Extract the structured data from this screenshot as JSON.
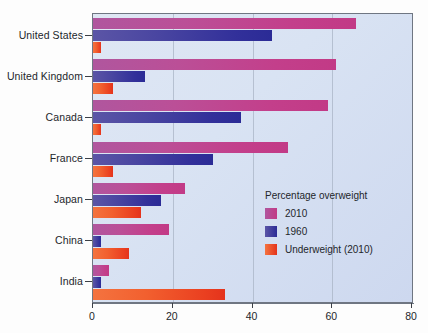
{
  "chart_data": {
    "type": "bar",
    "orientation": "horizontal",
    "title": "",
    "xlabel": "",
    "ylabel": "",
    "xlim": [
      0,
      80
    ],
    "xticks": [
      0,
      20,
      40,
      60,
      80
    ],
    "xtick_labels": [
      "0",
      "20",
      "40",
      "60",
      "80"
    ],
    "grid": true,
    "grid_axis": "x",
    "legend_position": "inside-right",
    "legend_title": "Percentage overweight",
    "categories": [
      "United States",
      "United Kingdom",
      "Canada",
      "France",
      "Japan",
      "China",
      "India"
    ],
    "series": [
      {
        "name": "2010",
        "color": "#c23a86",
        "values": [
          66,
          61,
          59,
          49,
          23,
          19,
          4
        ]
      },
      {
        "name": "1960",
        "color": "#2b2b96",
        "values": [
          45,
          13,
          37,
          30,
          17,
          2,
          2
        ]
      },
      {
        "name": "Underweight (2010)",
        "color": "#ea3f20",
        "values": [
          2,
          5,
          2,
          5,
          12,
          9,
          33
        ]
      }
    ]
  },
  "legend": {
    "title": "Percentage overweight",
    "entries": [
      {
        "label": "2010",
        "color": "#c23a86"
      },
      {
        "label": "1960",
        "color": "#2b2b96"
      },
      {
        "label": "Underweight (2010)",
        "color": "#ea3f20"
      }
    ]
  }
}
